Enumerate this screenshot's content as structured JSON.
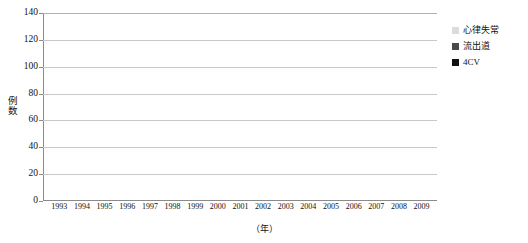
{
  "chart_data": {
    "type": "bar",
    "stacked": true,
    "title": "",
    "xlabel": "（年）",
    "ylabel": "例数",
    "ylim": [
      0,
      140
    ],
    "yticks": [
      0,
      20,
      40,
      60,
      80,
      100,
      120,
      140
    ],
    "grid": true,
    "legend_position": "right-top",
    "categories": [
      "1993",
      "1994",
      "1995",
      "1996",
      "1997",
      "1998",
      "1999",
      "2000",
      "2001",
      "2002",
      "2003",
      "2004",
      "2005",
      "2006",
      "2007",
      "2008",
      "2009"
    ],
    "series": [
      {
        "name": "4CV",
        "color": "#111111",
        "values": [
          2,
          2,
          4,
          4,
          7,
          8,
          14,
          19,
          22,
          43,
          43,
          47,
          57,
          75,
          57,
          66,
          85
        ]
      },
      {
        "name": "流出道",
        "color": "#4a4a4a",
        "values": [
          0,
          0,
          0,
          2,
          3,
          3,
          4,
          5,
          5,
          10,
          16,
          20,
          22,
          15,
          45,
          19,
          36
        ]
      },
      {
        "name": "心律失常",
        "color": "#dcdcdc",
        "values": [
          3,
          6,
          7,
          7,
          4,
          6,
          6,
          10,
          3,
          21,
          22,
          25,
          13,
          10,
          26,
          24,
          19
        ]
      }
    ],
    "totals": [
      5,
      8,
      11,
      13,
      14,
      17,
      24,
      34,
      30,
      74,
      81,
      92,
      92,
      100,
      128,
      109,
      140
    ]
  },
  "legend": {
    "items": [
      {
        "label": "心律失常"
      },
      {
        "label": "流出道"
      },
      {
        "label": "4CV"
      }
    ]
  },
  "caption": {
    "text": ""
  }
}
